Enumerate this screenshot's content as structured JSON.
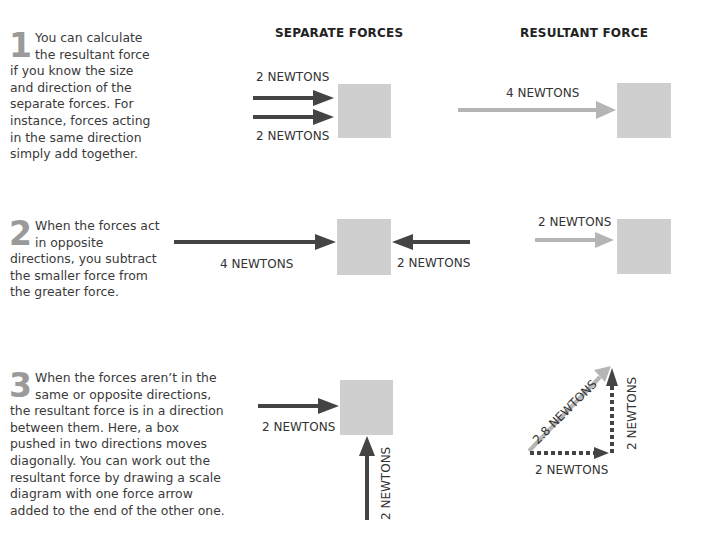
{
  "headers": {
    "separate": "SEPARATE FORCES",
    "resultant": "RESULTANT FORCE"
  },
  "sections": [
    {
      "number": "1",
      "text": "You can calculate the resultant force if you know the size and direction of the separate forces. For instance, forces acting in the same direction simply add together.",
      "separate_labels": [
        "2 NEWTONS",
        "2 NEWTONS"
      ],
      "resultant_label": "4 NEWTONS"
    },
    {
      "number": "2",
      "text": "When the forces act in opposite directions, you subtract the smaller force from the greater force.",
      "separate_labels": [
        "4 NEWTONS",
        "2 NEWTONS"
      ],
      "resultant_label": "2 NEWTONS"
    },
    {
      "number": "3",
      "text": "When the forces aren’t in the same or opposite directions, the resultant force is in a direction between them. Here, a box pushed in two directions moves diagonally. You can work out the resultant force by drawing a scale diagram with one force arrow added to the end of the other one.",
      "separate_labels": [
        "2 NEWTONS",
        "2 NEWTONS"
      ],
      "resultant_labels": [
        "2.8 NEWTONS",
        "2 NEWTONS",
        "2 NEWTONS"
      ]
    }
  ],
  "colors": {
    "force_arrow": "#444444",
    "resultant_arrow": "#b5b5b5",
    "box": "#cfcfcf",
    "numeral": "#9a9a9a"
  }
}
